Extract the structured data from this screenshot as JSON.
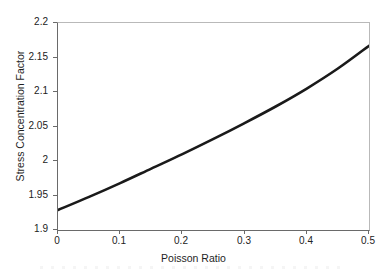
{
  "chart_data": {
    "type": "line",
    "title": "",
    "xlabel": "Poisson Ratio",
    "ylabel": "Stress Concentration Factor",
    "xlim": [
      0,
      0.5
    ],
    "ylim": [
      1.9,
      2.2
    ],
    "xticks": [
      "0",
      "0.1",
      "0.2",
      "0.3",
      "0.4",
      "0.5"
    ],
    "xtick_values": [
      0,
      0.1,
      0.2,
      0.3,
      0.4,
      0.5
    ],
    "yticks": [
      "1.9",
      "1.95",
      "2",
      "2.05",
      "2.1",
      "2.15",
      "2.2"
    ],
    "ytick_values": [
      1.9,
      1.95,
      2.0,
      2.05,
      2.1,
      2.15,
      2.2
    ],
    "grid": false,
    "legend": false,
    "legend_position": "none",
    "series": [
      {
        "name": "Stress Concentration Factor",
        "color": "#1a1a1a",
        "line_width": 2.6,
        "x": [
          0.0,
          0.05,
          0.1,
          0.15,
          0.2,
          0.25,
          0.3,
          0.35,
          0.4,
          0.45,
          0.5
        ],
        "values": [
          1.929,
          1.948,
          1.968,
          1.989,
          2.01,
          2.032,
          2.055,
          2.079,
          2.105,
          2.134,
          2.167
        ]
      }
    ]
  },
  "axes": {
    "x_title": "Poisson Ratio",
    "y_title": "Stress Concentration Factor",
    "x_labels": [
      "0",
      "0.1",
      "0.2",
      "0.3",
      "0.4",
      "0.5"
    ],
    "y_labels": [
      "2.2",
      "2.15",
      "2.1",
      "2.05",
      "2",
      "1.95",
      "1.9"
    ]
  },
  "colors": {
    "curve": "#1a1a1a",
    "axis": "#6a6a6a",
    "frame_light": "#b9b9b9",
    "background": "#ffffff",
    "text": "#1f1f1f"
  }
}
